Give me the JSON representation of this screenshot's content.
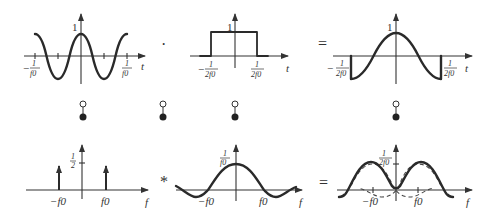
{
  "diagram": {
    "top_row": {
      "operator_1": "·",
      "operator_2": "=",
      "plots": [
        {
          "name": "cosine",
          "axis_label": "t",
          "peak_label": "1",
          "tick_labels": {
            "left_num": "1",
            "left_den": "f0",
            "left_sign": "−",
            "right_num": "1",
            "right_den": "f0"
          }
        },
        {
          "name": "rectangular-window",
          "axis_label": "t",
          "peak_label": "1",
          "tick_labels": {
            "left_num": "1",
            "left_den": "2f0",
            "left_sign": "−",
            "right_num": "1",
            "right_den": "2f0"
          }
        },
        {
          "name": "windowed-cosine",
          "axis_label": "t",
          "peak_label": "1",
          "tick_labels": {
            "left_num": "1",
            "left_den": "2f0",
            "left_sign": "−",
            "right_num": "1",
            "right_den": "2f0"
          }
        }
      ]
    },
    "bottom_row": {
      "operator_1": "*",
      "operator_2": "=",
      "plots": [
        {
          "name": "delta-pair-spectrum",
          "axis_label": "f",
          "peak_num": "1",
          "peak_den": "2",
          "tick_labels": [
            "−f0",
            "f0"
          ]
        },
        {
          "name": "sinc-spectrum",
          "axis_label": "f",
          "peak_num": "1",
          "peak_den": "f0",
          "tick_labels": [
            "−f0",
            "f0"
          ]
        },
        {
          "name": "resulting-spectrum",
          "axis_label": "f",
          "peak_num": "1",
          "peak_den": "2f0",
          "tick_labels": [
            "−f0",
            "f0"
          ]
        }
      ]
    },
    "transform_connectors": [
      {
        "x": 83,
        "label": "Fourier pair"
      },
      {
        "x": 163,
        "label": "Fourier pair"
      },
      {
        "x": 235,
        "label": "Fourier pair"
      },
      {
        "x": 396,
        "label": "Fourier pair"
      }
    ]
  }
}
